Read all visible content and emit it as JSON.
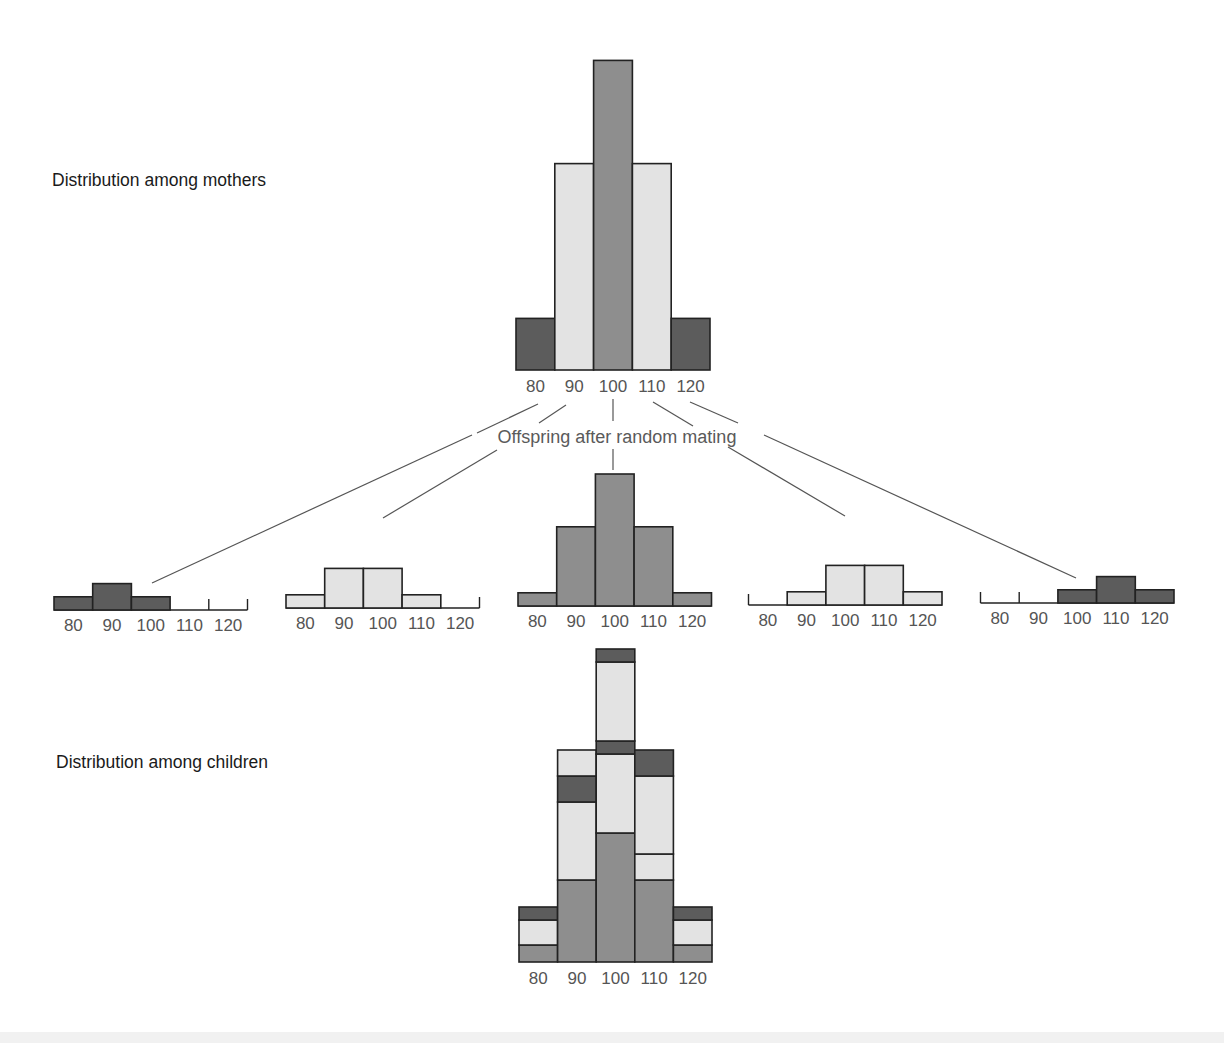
{
  "labels": {
    "mothers": "Distribution among mothers",
    "children": "Distribution among children",
    "offspring": "Offspring after random mating"
  },
  "colors": {
    "dark": "#5c5c5c",
    "mid": "#8e8e8e",
    "light": "#e3e3e3",
    "stroke": "#222222",
    "line": "#555555"
  },
  "chart_data": [
    {
      "type": "bar",
      "title": "Distribution among mothers",
      "categories": [
        "80",
        "90",
        "100",
        "110",
        "120"
      ],
      "values": [
        1,
        4,
        6,
        4,
        1
      ],
      "fill": [
        "dark",
        "light",
        "mid",
        "light",
        "dark"
      ],
      "xlabel": "",
      "ylabel": ""
    },
    {
      "type": "bar",
      "title": "Offspring of 80 mothers",
      "categories": [
        "80",
        "90",
        "100",
        "110",
        "120"
      ],
      "values": [
        1,
        2,
        1,
        0,
        0
      ],
      "fill": "dark"
    },
    {
      "type": "bar",
      "title": "Offspring of 90 mothers",
      "categories": [
        "80",
        "90",
        "100",
        "110",
        "120"
      ],
      "values": [
        1,
        3,
        3,
        1,
        0
      ],
      "fill": "light"
    },
    {
      "type": "bar",
      "title": "Offspring of 100 mothers",
      "categories": [
        "80",
        "90",
        "100",
        "110",
        "120"
      ],
      "values": [
        1,
        6,
        10,
        6,
        1
      ],
      "fill": "mid"
    },
    {
      "type": "bar",
      "title": "Offspring of 110 mothers",
      "categories": [
        "80",
        "90",
        "100",
        "110",
        "120"
      ],
      "values": [
        0,
        1,
        3,
        3,
        1
      ],
      "fill": "light"
    },
    {
      "type": "bar",
      "title": "Offspring of 120 mothers",
      "categories": [
        "80",
        "90",
        "100",
        "110",
        "120"
      ],
      "values": [
        0,
        0,
        1,
        2,
        1
      ],
      "fill": "dark"
    },
    {
      "type": "bar",
      "stacked": true,
      "title": "Distribution among children",
      "categories": [
        "80",
        "90",
        "100",
        "110",
        "120"
      ],
      "series": [
        {
          "name": "from 100 mothers (mid)",
          "values": [
            1,
            6,
            10,
            6,
            1
          ]
        },
        {
          "name": "from 90 mothers (light)",
          "values": [
            2,
            6,
            6,
            2,
            0
          ]
        },
        {
          "name": "from 110 mothers (light)",
          "values": [
            0,
            2,
            6,
            6,
            2
          ]
        },
        {
          "name": "from 80 mothers (dark)",
          "values": [
            1,
            2,
            1,
            0,
            0
          ]
        },
        {
          "name": "from 120 mothers (dark)",
          "values": [
            0,
            0,
            1,
            2,
            1
          ]
        }
      ],
      "segments_bottom_to_top": [
        [
          "mid",
          "light",
          "dark"
        ],
        [
          "mid",
          "light",
          "dark",
          "light"
        ],
        [
          "mid",
          "light",
          "dark",
          "light",
          "dark"
        ],
        [
          "mid",
          "light",
          "light",
          "dark"
        ],
        [
          "mid",
          "light",
          "dark"
        ]
      ],
      "segment_heights": [
        [
          17,
          25,
          13
        ],
        [
          82,
          78,
          26,
          26
        ],
        [
          129,
          79,
          13,
          79,
          13
        ],
        [
          82,
          26,
          78,
          26
        ],
        [
          17,
          25,
          13
        ]
      ]
    }
  ],
  "tick_labels": [
    "80",
    "90",
    "100",
    "110",
    "120"
  ]
}
